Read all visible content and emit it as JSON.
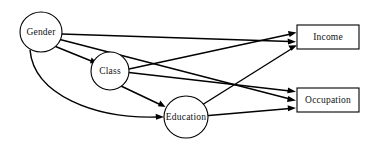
{
  "diagram": {
    "type": "path-diagram",
    "background_color": "#ffffff",
    "line_color": "#000000",
    "text_color": "#111111",
    "nodes": [
      {
        "id": "gender",
        "label": "Gender",
        "shape": "ellipse",
        "cx": 41,
        "cy": 32,
        "rx": 21,
        "ry": 20
      },
      {
        "id": "class",
        "label": "Class",
        "shape": "ellipse",
        "cx": 110,
        "cy": 71,
        "rx": 19,
        "ry": 19
      },
      {
        "id": "education",
        "label": "Education",
        "shape": "ellipse",
        "cx": 186,
        "cy": 117,
        "rx": 22,
        "ry": 21
      },
      {
        "id": "income",
        "label": "Income",
        "shape": "rectangle",
        "x": 297,
        "y": 25,
        "w": 62,
        "h": 24
      },
      {
        "id": "occupation",
        "label": "Occupation",
        "shape": "rectangle",
        "x": 297,
        "y": 88,
        "w": 62,
        "h": 24
      }
    ],
    "edges": [
      {
        "id": "gender-income",
        "from": "Gender",
        "to": "Income",
        "style": "straight",
        "arrow": true
      },
      {
        "id": "gender-occupation",
        "from": "Gender",
        "to": "Occupation",
        "style": "straight",
        "arrow": true
      },
      {
        "id": "gender-class",
        "from": "Gender",
        "to": "Class",
        "style": "straight",
        "arrow": true
      },
      {
        "id": "gender-education",
        "from": "Gender",
        "to": "Education",
        "style": "curved",
        "arrow": true
      },
      {
        "id": "class-income",
        "from": "Class",
        "to": "Income",
        "style": "straight",
        "arrow": true
      },
      {
        "id": "class-occupation",
        "from": "Class",
        "to": "Occupation",
        "style": "straight",
        "arrow": true
      },
      {
        "id": "class-education",
        "from": "Class",
        "to": "Education",
        "style": "straight",
        "arrow": true
      },
      {
        "id": "education-income",
        "from": "Education",
        "to": "Income",
        "style": "straight",
        "arrow": true
      },
      {
        "id": "education-occupation",
        "from": "Education",
        "to": "Occupation",
        "style": "straight",
        "arrow": true
      }
    ]
  }
}
